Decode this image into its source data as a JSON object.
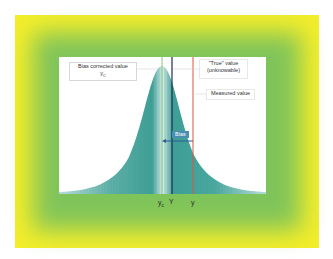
{
  "diagram": {
    "labels": {
      "bias_corrected": "Bias corrected value",
      "bias_corrected_symbol": "y",
      "bias_corrected_sub": "C",
      "true_value_line1": "\"True\" value",
      "true_value_line2": "(unknowable)",
      "measured": "Measured value",
      "bias": "Bias"
    },
    "axis_marks": {
      "yc_symbol": "y",
      "yc_sub": "c",
      "Y": "Y",
      "y": "y"
    },
    "colors": {
      "outer_frame": "#f4ee2a",
      "inner_frame": "#7fc45a",
      "curve_fill": "#4aa8a0",
      "corrected_line": "#8cc47a",
      "true_line": "#1f2a55",
      "measured_line": "#e0553a",
      "bias_arrow": "#2f5a92"
    }
  }
}
